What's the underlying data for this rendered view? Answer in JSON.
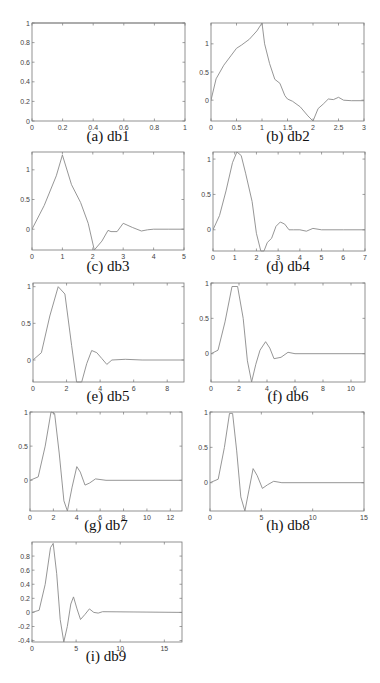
{
  "chart_data": [
    {
      "id": "a",
      "type": "line",
      "caption": "(a) db1",
      "title": "db1",
      "xlim": [
        0,
        1
      ],
      "ylim": [
        0,
        1
      ],
      "xticks": [
        "0",
        "0.2",
        "0.4",
        "0.6",
        "0.8",
        "1"
      ],
      "yticks": [
        "0",
        "0.2",
        "0.4",
        "0.6",
        "0.8",
        "1"
      ],
      "x": [
        0,
        1
      ],
      "y": [
        1,
        1
      ]
    },
    {
      "id": "b",
      "type": "line",
      "caption": "(b) db2",
      "title": "db2",
      "xlim": [
        0,
        3
      ],
      "ylim": [
        -0.37,
        1.37
      ],
      "xticks": [
        "0",
        "0.5",
        "1",
        "1.5",
        "2",
        "2.5",
        "3"
      ],
      "yticks": [
        "0",
        "0.5",
        "1"
      ],
      "x": [
        0,
        0.1,
        0.25,
        0.4,
        0.5,
        0.6,
        0.75,
        0.9,
        1.0,
        1.05,
        1.15,
        1.25,
        1.35,
        1.45,
        1.5,
        1.6,
        1.75,
        1.9,
        2.0,
        2.1,
        2.2,
        2.3,
        2.4,
        2.5,
        2.6,
        2.75,
        3.0
      ],
      "y": [
        0,
        0.38,
        0.62,
        0.8,
        0.92,
        0.98,
        1.08,
        1.23,
        1.37,
        1.0,
        0.65,
        0.37,
        0.3,
        0.08,
        0.02,
        -0.02,
        -0.12,
        -0.28,
        -0.37,
        -0.15,
        -0.07,
        0.02,
        0.01,
        0.05,
        0.0,
        -0.01,
        -0.01
      ]
    },
    {
      "id": "c",
      "type": "line",
      "caption": "(c) db3",
      "title": "db3",
      "xlim": [
        0,
        5
      ],
      "ylim": [
        -0.35,
        1.3
      ],
      "xticks": [
        "0",
        "1",
        "2",
        "3",
        "4",
        "5"
      ],
      "yticks": [
        "0",
        "0.5",
        "1"
      ],
      "x": [
        0,
        0.4,
        0.8,
        1.0,
        1.3,
        1.6,
        1.85,
        2.05,
        2.3,
        2.5,
        2.6,
        2.8,
        3.0,
        3.3,
        3.6,
        3.8,
        4.0,
        4.5,
        5.0
      ],
      "y": [
        0,
        0.4,
        0.9,
        1.25,
        0.75,
        0.45,
        0.1,
        -0.35,
        -0.2,
        -0.02,
        -0.04,
        -0.04,
        0.1,
        0.03,
        -0.03,
        -0.01,
        0.0,
        0.0,
        0.0
      ]
    },
    {
      "id": "d",
      "type": "line",
      "caption": "(d) db4",
      "title": "db4",
      "xlim": [
        0,
        7
      ],
      "ylim": [
        -0.3,
        1.1
      ],
      "xticks": [
        "0",
        "1",
        "2",
        "3",
        "4",
        "5",
        "6",
        "7"
      ],
      "yticks": [
        "0",
        "0.5",
        "1"
      ],
      "x": [
        0,
        0.3,
        0.6,
        0.9,
        1.1,
        1.3,
        1.5,
        1.8,
        2.0,
        2.2,
        2.35,
        2.5,
        2.7,
        2.9,
        3.1,
        3.3,
        3.5,
        3.7,
        4.0,
        4.3,
        4.6,
        5.0,
        6.0,
        7.0
      ],
      "y": [
        0,
        0.2,
        0.55,
        0.95,
        1.1,
        1.05,
        0.8,
        0.4,
        -0.05,
        -0.3,
        -0.3,
        -0.18,
        -0.12,
        0.05,
        0.11,
        0.08,
        0.0,
        0.0,
        0.0,
        -0.02,
        0.02,
        0.0,
        0.0,
        0.0
      ]
    },
    {
      "id": "e",
      "type": "line",
      "caption": "(e) db5",
      "title": "db5",
      "xlim": [
        0,
        9
      ],
      "ylim": [
        -0.3,
        1.05
      ],
      "xticks": [
        "0",
        "2",
        "4",
        "6",
        "8"
      ],
      "yticks": [
        "0",
        "0.5",
        "1"
      ],
      "x": [
        0,
        0.5,
        1.0,
        1.5,
        1.9,
        2.3,
        2.6,
        2.9,
        3.2,
        3.5,
        3.8,
        4.1,
        4.4,
        4.7,
        5.5,
        6.5,
        9.0
      ],
      "y": [
        0,
        0.1,
        0.6,
        1.0,
        0.9,
        0.2,
        -0.3,
        -0.3,
        -0.05,
        0.13,
        0.1,
        0.02,
        -0.06,
        0.0,
        0.01,
        0.0,
        0.0
      ]
    },
    {
      "id": "f",
      "type": "line",
      "caption": "(f) db6",
      "title": "db6",
      "xlim": [
        0,
        11
      ],
      "ylim": [
        -0.4,
        1.0
      ],
      "xticks": [
        "0",
        "2",
        "4",
        "6",
        "8",
        "10"
      ],
      "yticks": [
        "0",
        "0.5",
        "1"
      ],
      "x": [
        0,
        0.5,
        1.0,
        1.5,
        1.9,
        2.3,
        2.6,
        2.9,
        3.2,
        3.5,
        3.9,
        4.2,
        4.5,
        5.0,
        5.5,
        6.0,
        11.0
      ],
      "y": [
        0,
        0.05,
        0.45,
        0.95,
        0.95,
        0.5,
        -0.1,
        -0.4,
        -0.15,
        0.05,
        0.17,
        0.08,
        -0.07,
        -0.05,
        0.02,
        0.0,
        0.0
      ]
    },
    {
      "id": "g",
      "type": "line",
      "caption": "(g) db7",
      "title": "db7",
      "xlim": [
        0,
        13
      ],
      "ylim": [
        -0.45,
        1.0
      ],
      "xticks": [
        "0",
        "2",
        "4",
        "6",
        "8",
        "10",
        "12"
      ],
      "yticks": [
        "0",
        "0.5",
        "1"
      ],
      "x": [
        0,
        0.7,
        1.3,
        1.8,
        2.1,
        2.5,
        2.9,
        3.2,
        3.6,
        4.0,
        4.3,
        4.7,
        5.1,
        5.6,
        6.5,
        13.0
      ],
      "y": [
        0,
        0.05,
        0.5,
        1.0,
        0.98,
        0.4,
        -0.3,
        -0.45,
        -0.1,
        0.2,
        0.12,
        -0.07,
        -0.04,
        0.02,
        0.0,
        0.0
      ]
    },
    {
      "id": "h",
      "type": "line",
      "caption": "(h) db8",
      "title": "db8",
      "xlim": [
        0,
        15
      ],
      "ylim": [
        -0.4,
        1.0
      ],
      "xticks": [
        "0",
        "5",
        "10",
        "15"
      ],
      "yticks": [
        "0",
        "0.5",
        "1"
      ],
      "x": [
        0,
        0.8,
        1.4,
        1.9,
        2.2,
        2.6,
        3.0,
        3.4,
        3.8,
        4.2,
        4.6,
        5.1,
        5.6,
        6.2,
        7.0,
        15.0
      ],
      "y": [
        0,
        0.05,
        0.5,
        0.98,
        0.98,
        0.45,
        -0.2,
        -0.4,
        -0.1,
        0.2,
        0.1,
        -0.08,
        -0.03,
        0.02,
        0.0,
        0.0
      ]
    },
    {
      "id": "i",
      "type": "line",
      "caption": "(i) db9",
      "title": "db9",
      "xlim": [
        0,
        17
      ],
      "ylim": [
        -0.42,
        1.0
      ],
      "xticks": [
        "0",
        "5",
        "10",
        "15"
      ],
      "yticks": [
        "-0.4",
        "-0.2",
        "0",
        "0.2",
        "0.4",
        "0.6",
        "0.8"
      ],
      "x": [
        0,
        0.8,
        1.5,
        2.1,
        2.4,
        2.8,
        3.2,
        3.6,
        4.0,
        4.4,
        4.7,
        5.1,
        5.5,
        6.0,
        6.5,
        7.0,
        7.5,
        8.0,
        17.0
      ],
      "y": [
        0,
        0.03,
        0.4,
        0.92,
        0.98,
        0.55,
        -0.1,
        -0.42,
        -0.2,
        0.12,
        0.22,
        0.05,
        -0.1,
        -0.03,
        0.05,
        0.0,
        -0.01,
        0.01,
        0.0
      ]
    }
  ]
}
